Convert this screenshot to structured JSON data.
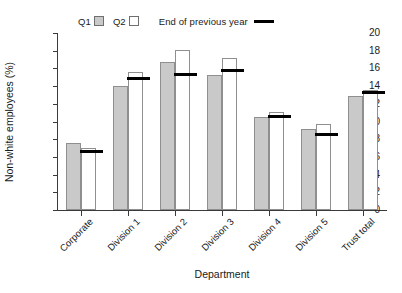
{
  "chart_data": {
    "type": "bar",
    "title": "",
    "xlabel": "Department",
    "ylabel": "Non-white employees (%)",
    "ylim": [
      0,
      20
    ],
    "ytick_step": 2,
    "yticks": [
      0,
      2,
      4,
      6,
      8,
      10,
      12,
      14,
      16,
      18,
      20
    ],
    "grid": false,
    "legend_position": "top",
    "categories": [
      "Corporate",
      "Division 1",
      "Division 2",
      "Division 3",
      "Division 4",
      "Division 5",
      "Trust total"
    ],
    "series": [
      {
        "name": "Q1",
        "type": "bar",
        "color": "#c9c9c9",
        "values": [
          7.6,
          14.0,
          16.7,
          15.3,
          10.5,
          9.2,
          12.9
        ]
      },
      {
        "name": "Q2",
        "type": "bar",
        "color": "#ffffff",
        "values": [
          7.0,
          15.6,
          18.1,
          17.2,
          11.1,
          9.7,
          13.6
        ]
      },
      {
        "name": "End of previous year",
        "type": "marker-line",
        "color": "#000000",
        "values": [
          6.6,
          14.9,
          15.3,
          15.8,
          10.6,
          8.5,
          13.3
        ]
      }
    ]
  },
  "legend": {
    "q1_label": "Q1",
    "q2_label": "Q2",
    "prev_label": "End of previous year"
  },
  "axes": {
    "y_title": "Non-white employees (%)",
    "x_title": "Department",
    "y_tick_labels": [
      "20",
      "18",
      "16",
      "14",
      "12",
      "10",
      "8",
      "6",
      "4",
      "2",
      "0"
    ]
  }
}
